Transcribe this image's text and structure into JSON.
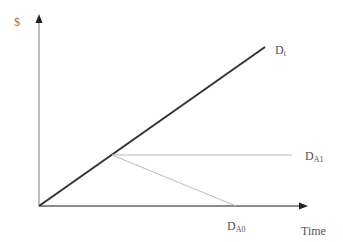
{
  "diagram": {
    "y_axis_label": "$",
    "x_axis_label": "Time",
    "lines": [
      {
        "id": "Dt",
        "main": "D",
        "sub": "t",
        "style": "thick",
        "color": "#333333"
      },
      {
        "id": "DA1",
        "main": "D",
        "sub": "A1",
        "style": "thin",
        "color": "#bbbbbb"
      },
      {
        "id": "DA0",
        "main": "D",
        "sub": "A0",
        "style": "thin",
        "color": "#bbbbbb"
      }
    ]
  }
}
